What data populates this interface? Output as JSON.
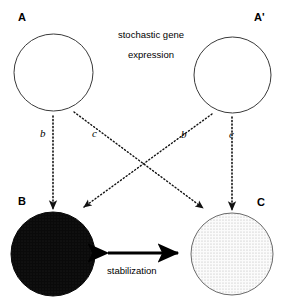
{
  "diagram": {
    "title_caption": {
      "line1": "stochastic gene",
      "line2": "expression"
    },
    "nodes": [
      {
        "id": "A",
        "label": "A",
        "state": "empty",
        "fill": "#ffffff",
        "stroke": "#333333"
      },
      {
        "id": "Ap",
        "label": "A'",
        "state": "empty",
        "fill": "#ffffff",
        "stroke": "#333333"
      },
      {
        "id": "B",
        "label": "B",
        "state": "filled",
        "fill": "#0d0d0d",
        "stroke": "#0d0d0d"
      },
      {
        "id": "C",
        "label": "C",
        "state": "stippled",
        "fill": "#f0f0f0",
        "stroke": "#555555"
      }
    ],
    "rates": {
      "b_left": "b",
      "c_left": "c",
      "b_right": "b",
      "c_right": "c"
    },
    "edges": [
      {
        "from": "A",
        "to": "B",
        "rate": "b",
        "style": "dotted-arrow"
      },
      {
        "from": "A",
        "to": "C",
        "rate": "c",
        "style": "dotted-arrow"
      },
      {
        "from": "Ap",
        "to": "B",
        "rate": "b",
        "style": "dotted-arrow"
      },
      {
        "from": "Ap",
        "to": "C",
        "rate": "c",
        "style": "dotted-arrow"
      },
      {
        "from": "B",
        "to": "C",
        "rate": "",
        "style": "solid-double-arrow",
        "label": "stabilization"
      }
    ],
    "stabilization_label": "stabilization",
    "colors": {
      "background": "#ffffff",
      "ink": "#000000",
      "filled_node": "#0d0d0d",
      "stippled_node": "#f0f0f0",
      "outline": "#333333"
    }
  }
}
